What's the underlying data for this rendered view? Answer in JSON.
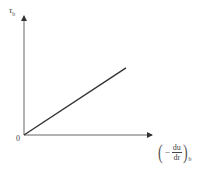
{
  "chart_data": {
    "type": "line",
    "title": "",
    "xlabel": "(−du/dr)_b",
    "ylabel": "τ_b",
    "origin_label": "0",
    "series": [
      {
        "name": "shear stress vs shear rate",
        "x": [
          0,
          1
        ],
        "y": [
          0,
          0.56
        ],
        "color": "#333333"
      }
    ],
    "grid": false,
    "legend": null,
    "axis_style": "arrows"
  },
  "labels": {
    "y_main": "τ",
    "y_sub": "b",
    "origin": "0",
    "x_minus": "−",
    "x_num": "du",
    "x_den": "dr",
    "x_sub": "b",
    "paren_left": "(",
    "paren_right": ")"
  },
  "colors": {
    "axis": "#555555",
    "line": "#333333",
    "text": "#444444"
  }
}
